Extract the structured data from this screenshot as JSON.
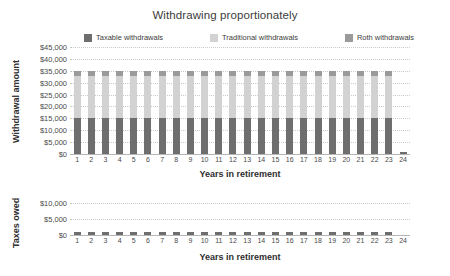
{
  "chart_data": [
    {
      "id": "withdrawal-amount",
      "type": "bar",
      "stacked": true,
      "title": "Withdrawing proportionately",
      "xlabel": "Years in retirement",
      "ylabel": "Withdrawal amount",
      "ylim": [
        0,
        45000
      ],
      "ytick_labels": [
        "$45,000",
        "$40,000",
        "$35,000",
        "$30,000",
        "$25,000",
        "$20,000",
        "$15,000",
        "$10,000",
        "$5,000",
        "$0"
      ],
      "ytick_values": [
        45000,
        40000,
        35000,
        30000,
        25000,
        20000,
        15000,
        10000,
        5000,
        0
      ],
      "grid": true,
      "legend_position": "top",
      "categories": [
        "1",
        "2",
        "3",
        "4",
        "5",
        "6",
        "7",
        "8",
        "9",
        "10",
        "11",
        "12",
        "13",
        "14",
        "15",
        "16",
        "17",
        "18",
        "19",
        "20",
        "21",
        "22",
        "23",
        "24"
      ],
      "series": [
        {
          "name": "Taxable withdrawals",
          "color": "#6e6e6e",
          "values": [
            15000,
            15000,
            15000,
            15000,
            15000,
            15000,
            15000,
            15000,
            15000,
            15000,
            15000,
            15000,
            15000,
            15000,
            15000,
            15000,
            15000,
            15000,
            15000,
            15000,
            15000,
            15000,
            15000,
            1000
          ]
        },
        {
          "name": "Traditional withdrawals",
          "color": "#d2d2d2",
          "values": [
            18000,
            18000,
            18000,
            18000,
            18000,
            18000,
            18000,
            18000,
            18000,
            18000,
            18000,
            18000,
            18000,
            18000,
            18000,
            18000,
            18000,
            18000,
            18000,
            18000,
            18000,
            18000,
            18000,
            0
          ]
        },
        {
          "name": "Roth withdrawals",
          "color": "#9a9a9a",
          "values": [
            2000,
            2000,
            2000,
            2000,
            2000,
            2000,
            2000,
            2000,
            2000,
            2000,
            2000,
            2000,
            2000,
            2000,
            2000,
            2000,
            2000,
            2000,
            2000,
            2000,
            2000,
            2000,
            2000,
            0
          ]
        }
      ]
    },
    {
      "id": "taxes-owed",
      "type": "bar",
      "stacked": false,
      "title": "",
      "xlabel": "Years in retirement",
      "ylabel": "Taxes owed",
      "ylim": [
        0,
        12000
      ],
      "ytick_labels": [
        "$10,000",
        "$5,000",
        "$0"
      ],
      "ytick_values": [
        10000,
        5000,
        0
      ],
      "grid": true,
      "legend_position": "none",
      "categories": [
        "1",
        "2",
        "3",
        "4",
        "5",
        "6",
        "7",
        "8",
        "9",
        "10",
        "11",
        "12",
        "13",
        "14",
        "15",
        "16",
        "17",
        "18",
        "19",
        "20",
        "21",
        "22",
        "23",
        "24"
      ],
      "series": [
        {
          "name": "Taxes owed",
          "color": "#6e6e6e",
          "values": [
            900,
            900,
            900,
            900,
            900,
            900,
            900,
            900,
            900,
            900,
            900,
            900,
            900,
            900,
            900,
            900,
            900,
            900,
            900,
            900,
            900,
            900,
            900,
            0
          ]
        }
      ]
    }
  ],
  "top_chart": {
    "title": "Withdrawing proportionately",
    "y_axis_title": "Withdrawal amount",
    "x_axis_title": "Years in retirement"
  },
  "bottom_chart": {
    "y_axis_title": "Taxes owed",
    "x_axis_title": "Years in retirement"
  },
  "legend": {
    "items": [
      {
        "label": "Taxable withdrawals",
        "color": "#6e6e6e"
      },
      {
        "label": "Traditional withdrawals",
        "color": "#d2d2d2"
      },
      {
        "label": "Roth withdrawals",
        "color": "#9a9a9a"
      }
    ]
  },
  "colors": {
    "taxable": "#6e6e6e",
    "traditional": "#d2d2d2",
    "roth": "#9a9a9a",
    "gridline": "#d9d9d9",
    "text": "#3c3c3c",
    "background": "#ffffff"
  }
}
